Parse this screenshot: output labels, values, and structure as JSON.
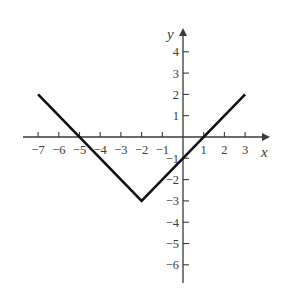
{
  "chart_data": {
    "type": "line",
    "title": "",
    "xlabel": "x",
    "ylabel": "y",
    "xlim": [
      -7,
      3
    ],
    "ylim": [
      -6,
      4
    ],
    "grid": false,
    "legend": null,
    "x_ticks": [
      -7,
      -6,
      -5,
      -4,
      -3,
      -2,
      -1,
      1,
      2,
      3
    ],
    "x_tick_labels": [
      "−7",
      "−6",
      "−5",
      "−4",
      "−3",
      "−2",
      "−1",
      "1",
      "2",
      "3"
    ],
    "y_ticks": [
      4,
      3,
      2,
      1,
      -1,
      -2,
      -3,
      -4,
      -5,
      -6
    ],
    "y_tick_labels": [
      "4",
      "3",
      "2",
      "1",
      "−1",
      "−2",
      "−3",
      "−4",
      "−5",
      "−6"
    ],
    "series": [
      {
        "name": "piecewise linear (V shape)",
        "points": [
          [
            -7,
            2
          ],
          [
            -2,
            -3
          ],
          [
            3,
            2
          ]
        ],
        "color": "#111111"
      }
    ],
    "annotations": {
      "x_intercepts": [
        -5,
        1
      ],
      "y_intercept": -1,
      "vertex": [
        -2,
        -3
      ]
    }
  },
  "colors": {
    "axis": "#3a3a3a",
    "line": "#111111",
    "background": "#ffffff"
  }
}
